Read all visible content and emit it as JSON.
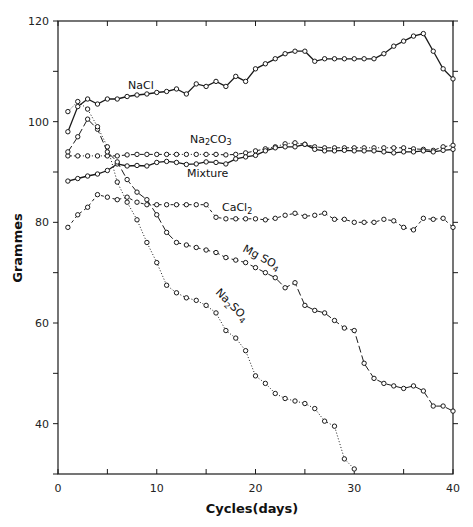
{
  "chart_data": {
    "type": "line",
    "title": "",
    "xlabel": "Cycles(days)",
    "ylabel": "Grammes",
    "xlim": [
      0,
      40
    ],
    "ylim": [
      30,
      120
    ],
    "xticks": [
      0,
      10,
      20,
      30,
      40
    ],
    "xminor": [
      5,
      15,
      25,
      35
    ],
    "yticks": [
      40,
      60,
      80,
      100,
      120
    ],
    "yminor": [
      50,
      70,
      90,
      110
    ],
    "grid": false,
    "legend": "inline labels",
    "series": [
      {
        "name": "NaCl",
        "label_html": "NaCl",
        "style": "solid",
        "label_pos": [
          8.2,
          106.8
        ],
        "x": [
          1,
          2,
          3,
          4,
          5,
          6,
          7,
          8,
          9,
          10,
          11,
          12,
          13,
          14,
          15,
          16,
          17,
          18,
          19,
          20,
          21,
          22,
          23,
          24,
          25,
          26,
          27,
          28,
          29,
          30,
          31,
          32,
          33,
          34,
          35,
          36,
          37,
          38,
          39,
          40
        ],
        "values": [
          98,
          103,
          104.5,
          103.5,
          104.5,
          104.5,
          105,
          105.3,
          105.5,
          105.8,
          106,
          106.5,
          105.5,
          107.5,
          107,
          108,
          107,
          109,
          108,
          110.5,
          111.5,
          112.5,
          113.5,
          114,
          114,
          112,
          112.5,
          112.5,
          112.5,
          112.5,
          112.5,
          112.5,
          113.5,
          115,
          116,
          117,
          117.5,
          114,
          110.5,
          108.5
        ]
      },
      {
        "name": "Na2CO3",
        "style": "dash-dot",
        "label_pos": [
          13.3,
          96.3
        ],
        "x": [
          1,
          2,
          3,
          4,
          5,
          6,
          7,
          8,
          9,
          10,
          11,
          12,
          13,
          14,
          15,
          16,
          17,
          18,
          19,
          20,
          21,
          22,
          23,
          24,
          25,
          26,
          27,
          28,
          29,
          30,
          31,
          32,
          33,
          34,
          35,
          36,
          37,
          38,
          39,
          40
        ],
        "values": [
          93.2,
          93.2,
          93.2,
          93.2,
          93.2,
          93.2,
          93.4,
          93.5,
          93.5,
          93.5,
          93.5,
          93.5,
          93.5,
          93.5,
          93.5,
          93.5,
          93.4,
          93.5,
          93.8,
          94.2,
          94.6,
          95,
          95.6,
          95.8,
          95.5,
          95,
          94.8,
          94.8,
          94.8,
          94.8,
          94.8,
          94.8,
          94.8,
          94.8,
          94.8,
          94.6,
          94.5,
          94.3,
          95,
          95.3
        ]
      },
      {
        "name": "Mixture",
        "style": "solid",
        "label_pos": [
          13.8,
          89.4
        ],
        "x": [
          1,
          2,
          3,
          4,
          5,
          6,
          7,
          8,
          9,
          10,
          11,
          12,
          13,
          14,
          15,
          16,
          17,
          18,
          19,
          20,
          21,
          22,
          23,
          24,
          25,
          26,
          27,
          28,
          29,
          30,
          31,
          32,
          33,
          34,
          35,
          36,
          37,
          38,
          39,
          40
        ],
        "values": [
          88.2,
          88.7,
          89.2,
          89.6,
          90.3,
          91.6,
          91.2,
          91.3,
          91.2,
          91.9,
          92.1,
          91.9,
          91.5,
          91.6,
          92,
          91.9,
          91.6,
          92.6,
          93,
          93.3,
          94.2,
          94.8,
          95,
          95,
          95.5,
          94.5,
          94.2,
          94.2,
          94.3,
          94.2,
          94.2,
          94.2,
          94,
          93.8,
          94,
          94,
          94.2,
          94,
          94.3,
          94.5
        ]
      },
      {
        "name": "CaCl2",
        "style": "dashed-dotted",
        "label_pos": [
          20.3,
          82.3
        ],
        "x": [
          1,
          2,
          3,
          4,
          5,
          6,
          7,
          8,
          9,
          10,
          11,
          12,
          13,
          14,
          15,
          16,
          17,
          18,
          19,
          20,
          21,
          22,
          23,
          24,
          25,
          26,
          27,
          28,
          29,
          30,
          31,
          32,
          33,
          34,
          35,
          36,
          37,
          38,
          39,
          40
        ],
        "values": [
          79,
          81.5,
          83,
          85.5,
          85,
          84.5,
          85,
          84,
          83.5,
          83.5,
          83.5,
          83.5,
          83.5,
          83.5,
          83.5,
          81,
          80.7,
          80.7,
          80.7,
          80.7,
          80.5,
          80.8,
          81.4,
          81.8,
          81.2,
          81.4,
          81.8,
          80.6,
          80.6,
          80,
          80,
          80,
          80.6,
          80.3,
          79,
          78.5,
          80.8,
          80.6,
          80.8,
          79
        ]
      },
      {
        "name": "MgSO4",
        "style": "long-dash",
        "label_pos": [
          21.8,
          70.5
        ],
        "x": [
          1,
          2,
          3,
          4,
          5,
          6,
          7,
          8,
          9,
          10,
          11,
          12,
          13,
          14,
          15,
          16,
          17,
          18,
          19,
          20,
          21,
          22,
          23,
          24,
          25,
          26,
          27,
          28,
          29,
          30,
          31,
          32,
          33,
          34,
          35,
          36,
          37,
          38,
          39,
          40
        ],
        "values": [
          94,
          97,
          100.5,
          98.5,
          94,
          92,
          88.5,
          86,
          84.5,
          81.5,
          78,
          76,
          75.5,
          75,
          74.5,
          74,
          73,
          72.5,
          72,
          71,
          70,
          69,
          67,
          68,
          63.5,
          62.5,
          62,
          60.5,
          59,
          58.5,
          52,
          49,
          48,
          47.5,
          47,
          47.5,
          46.5,
          43.5,
          43.5,
          42.5
        ]
      },
      {
        "name": "Na2SO4",
        "style": "dotted",
        "label_pos": [
          16.6,
          66
        ],
        "x": [
          1,
          2,
          3,
          4,
          5,
          6,
          7,
          8,
          9,
          10,
          11,
          12,
          13,
          14,
          15,
          16,
          17,
          18,
          19,
          20,
          21,
          22,
          23,
          24,
          25,
          26,
          27,
          28,
          29,
          30
        ],
        "values": [
          102,
          104,
          102.5,
          99,
          95,
          88,
          84,
          80.5,
          76,
          72,
          67.5,
          66,
          65,
          64.5,
          63.5,
          62,
          58.5,
          57,
          54.5,
          49.5,
          48,
          46,
          45,
          44.5,
          44,
          43,
          40.5,
          39.5,
          33,
          31
        ]
      }
    ]
  },
  "labels": {
    "ylabel": "Grammes",
    "xlabel": "Cycles(days)",
    "nacl": "NaCl",
    "mixture": "Mixture",
    "na2co3_a": "Na",
    "na2co3_sub": "2",
    "na2co3_b": "CO",
    "na2co3_sub2": "3",
    "cacl2_a": "CaCl",
    "cacl2_sub": "2",
    "mgso4_a": "Mg SO",
    "mgso4_sub": "4",
    "na2so4_a": "Na",
    "na2so4_sub": "2",
    "na2so4_b": "SO",
    "na2so4_sub2": "4"
  },
  "colors": {
    "ink": "#1a1a1a",
    "background": "#ffffff"
  }
}
